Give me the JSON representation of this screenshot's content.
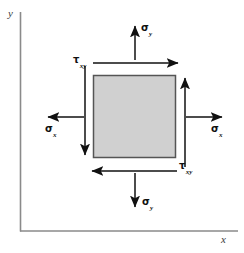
{
  "figure": {
    "background_color": "#ffffff",
    "axes": {
      "color": "#7d7d7d",
      "x_label": "x",
      "y_label": "y",
      "origin": {
        "x": 20,
        "y": 231
      },
      "x_axis_end": {
        "x": 238,
        "y": 231
      },
      "y_axis_top": {
        "x": 20,
        "y": 12
      }
    },
    "element": {
      "name": "stress-element-square",
      "fill_color": "#d0d0d0",
      "stroke_color": "#555555",
      "left": 93,
      "top": 75,
      "width": 83,
      "height": 83
    },
    "arrow_color": "#111111",
    "labels": {
      "sigma": "σ",
      "tau": "τ",
      "sub_x": "x",
      "sub_y": "y",
      "sub_xy": "xy"
    },
    "stresses": [
      {
        "id": "sigma-y-top",
        "symbol": "σ",
        "subscript": "y",
        "direction": "up",
        "label_x": 141,
        "label_y": 23
      },
      {
        "id": "sigma-y-bottom",
        "symbol": "σ",
        "subscript": "y",
        "direction": "down",
        "label_x": 142,
        "label_y": 197
      },
      {
        "id": "sigma-x-left",
        "symbol": "σ",
        "subscript": "x",
        "direction": "left",
        "label_x": 45,
        "label_y": 124
      },
      {
        "id": "sigma-x-right",
        "symbol": "σ",
        "subscript": "x",
        "direction": "right",
        "label_x": 211,
        "label_y": 124
      },
      {
        "id": "tau-xy-top",
        "symbol": "τ",
        "subscript": "xy",
        "direction": "right",
        "label_x": 74,
        "label_y": 55
      },
      {
        "id": "tau-xy-bottom",
        "symbol": "τ",
        "subscript": "xy",
        "direction": "left",
        "label_x": 179,
        "label_y": 162
      },
      {
        "id": "tau-left-vertical",
        "symbol": "τ",
        "subscript": "xy",
        "direction": "down",
        "label_x": null,
        "label_y": null
      },
      {
        "id": "tau-right-vertical",
        "symbol": "τ",
        "subscript": "xy",
        "direction": "up",
        "label_x": null,
        "label_y": null
      }
    ]
  }
}
